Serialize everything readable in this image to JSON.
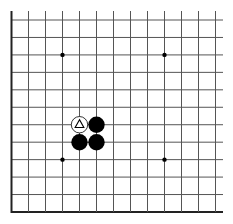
{
  "board": {
    "type": "go-board-fragment",
    "columns": 13,
    "rows": 12,
    "visible_edges": [
      "left",
      "bottom"
    ],
    "origin_x": 11.5,
    "bottom_y": 212,
    "top_y": 20,
    "col_spacing": 17,
    "colors": {
      "background": "#ffffff",
      "grid_line": "#555555",
      "edge_line": "#222222",
      "black_stone": "#000000",
      "white_stone": "#ffffff",
      "star_point": "#000000"
    },
    "star_points": [
      {
        "col": 3,
        "row": 2
      },
      {
        "col": 9,
        "row": 2
      },
      {
        "col": 3,
        "row": 8
      },
      {
        "col": 9,
        "row": 8
      }
    ],
    "stones": [
      {
        "col": 4,
        "row": 6,
        "color": "white",
        "marker": "triangle"
      },
      {
        "col": 5,
        "row": 6,
        "color": "black",
        "marker": ""
      },
      {
        "col": 4,
        "row": 7,
        "color": "black",
        "marker": ""
      },
      {
        "col": 5,
        "row": 7,
        "color": "black",
        "marker": ""
      }
    ]
  }
}
